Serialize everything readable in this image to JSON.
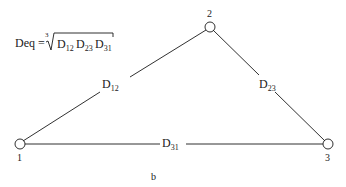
{
  "formula": {
    "lhs": "Deq",
    "equals": "=",
    "root_index": "3",
    "terms": [
      {
        "base": "D",
        "sub": "12"
      },
      {
        "base": "D",
        "sub": "23"
      },
      {
        "base": "D",
        "sub": "31"
      }
    ]
  },
  "nodes": [
    {
      "id": "1",
      "label": "1",
      "x": 20,
      "y": 144
    },
    {
      "id": "2",
      "label": "2",
      "x": 210,
      "y": 27
    },
    {
      "id": "3",
      "label": "3",
      "x": 328,
      "y": 144
    }
  ],
  "edges": [
    {
      "from": "1",
      "to": "2",
      "label_base": "D",
      "label_sub": "12"
    },
    {
      "from": "2",
      "to": "3",
      "label_base": "D",
      "label_sub": "23"
    },
    {
      "from": "3",
      "to": "1",
      "label_base": "D",
      "label_sub": "31"
    }
  ],
  "caption": "b",
  "colors": {
    "line": "#1a1a1a",
    "background": "#ffffff"
  }
}
